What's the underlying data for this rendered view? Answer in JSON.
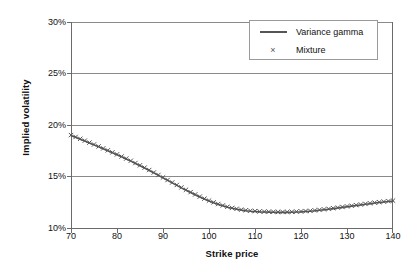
{
  "chart_data": {
    "type": "line",
    "title": "",
    "xlabel": "Strike price",
    "ylabel": "Implied volatility",
    "xlim": [
      70,
      140
    ],
    "ylim": [
      0.1,
      0.3
    ],
    "xticks": [
      "70",
      "80",
      "90",
      "100",
      "110",
      "120",
      "130",
      "140"
    ],
    "xtick_values": [
      70,
      80,
      90,
      100,
      110,
      120,
      130,
      140
    ],
    "yticks": [
      "10%",
      "15%",
      "20%",
      "25%",
      "30%"
    ],
    "ytick_values": [
      0.1,
      0.15,
      0.2,
      0.25,
      0.3
    ],
    "grid": "horizontal",
    "legend_position": "upper right",
    "legend": [
      "Variance gamma",
      "Mixture"
    ],
    "x": [
      70,
      71,
      72,
      73,
      74,
      75,
      76,
      77,
      78,
      79,
      80,
      81,
      82,
      83,
      84,
      85,
      86,
      87,
      88,
      89,
      90,
      91,
      92,
      93,
      94,
      95,
      96,
      97,
      98,
      99,
      100,
      101,
      102,
      103,
      104,
      105,
      106,
      107,
      108,
      109,
      110,
      111,
      112,
      113,
      114,
      115,
      116,
      117,
      118,
      119,
      120,
      121,
      122,
      123,
      124,
      125,
      126,
      127,
      128,
      129,
      130,
      131,
      132,
      133,
      134,
      135,
      136,
      137,
      138,
      139,
      140
    ],
    "series": [
      {
        "name": "Variance gamma",
        "style": "line",
        "color": "#555555",
        "values": [
          18.98,
          18.8,
          18.62,
          18.44,
          18.26,
          18.07,
          17.88,
          17.69,
          17.5,
          17.31,
          17.11,
          16.91,
          16.7,
          16.49,
          16.27,
          16.05,
          15.82,
          15.59,
          15.35,
          15.11,
          14.87,
          14.62,
          14.38,
          14.14,
          13.9,
          13.67,
          13.44,
          13.22,
          13.01,
          12.81,
          12.62,
          12.45,
          12.29,
          12.15,
          12.02,
          11.91,
          11.82,
          11.74,
          11.68,
          11.63,
          11.6,
          11.57,
          11.55,
          11.54,
          11.53,
          11.52,
          11.52,
          11.52,
          11.53,
          11.55,
          11.57,
          11.6,
          11.63,
          11.67,
          11.72,
          11.77,
          11.82,
          11.88,
          11.94,
          12.0,
          12.06,
          12.12,
          12.18,
          12.24,
          12.3,
          12.36,
          12.42,
          12.47,
          12.52,
          12.57,
          12.61
        ]
      },
      {
        "name": "Mixture",
        "style": "marker",
        "marker": "x",
        "color": "#555555",
        "values": [
          19.02,
          18.84,
          18.66,
          18.48,
          18.29,
          18.11,
          17.92,
          17.73,
          17.54,
          17.34,
          17.15,
          16.94,
          16.74,
          16.53,
          16.31,
          16.09,
          15.86,
          15.63,
          15.39,
          15.15,
          14.91,
          14.66,
          14.42,
          14.18,
          13.94,
          13.71,
          13.48,
          13.26,
          13.05,
          12.85,
          12.66,
          12.49,
          12.33,
          12.19,
          12.06,
          11.95,
          11.86,
          11.78,
          11.72,
          11.67,
          11.64,
          11.61,
          11.59,
          11.58,
          11.57,
          11.56,
          11.56,
          11.56,
          11.57,
          11.59,
          11.61,
          11.64,
          11.67,
          11.71,
          11.76,
          11.81,
          11.86,
          11.92,
          11.98,
          12.04,
          12.1,
          12.16,
          12.22,
          12.28,
          12.34,
          12.4,
          12.46,
          12.51,
          12.56,
          12.61,
          12.66
        ]
      }
    ]
  },
  "axes": {
    "ylabel": "Implied volatility",
    "xlabel": "Strike price",
    "ytick_labels": [
      "30%",
      "25%",
      "20%",
      "15%",
      "10%"
    ],
    "xtick_labels": [
      "70",
      "80",
      "90",
      "100",
      "110",
      "120",
      "130",
      "140"
    ]
  },
  "legend": {
    "items": [
      {
        "label": "Variance gamma",
        "key": "line-swatch"
      },
      {
        "label": "Mixture",
        "key": "cross-marker"
      }
    ]
  },
  "colors": {
    "curve": "#555555",
    "axis": "#6b6b6b",
    "grid": "#8a8a8a",
    "text": "#111111",
    "background": "#ffffff",
    "legend_border": "#9a9a9a"
  }
}
